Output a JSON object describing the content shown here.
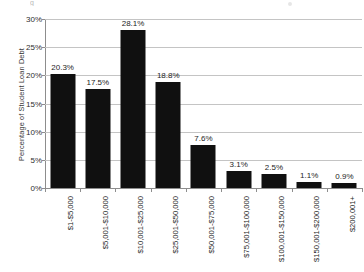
{
  "chart_data": {
    "type": "bar",
    "title": "",
    "xlabel": "",
    "ylabel": "Percentage of Student Loan Debt",
    "ylim": [
      0,
      30
    ],
    "ytick_labels": [
      "0%",
      "5%",
      "10%",
      "15%",
      "20%",
      "25%",
      "30%"
    ],
    "ytick_values": [
      0,
      5,
      10,
      15,
      20,
      25,
      30
    ],
    "grid": true,
    "legend": false,
    "categories": [
      "$1-$5,000",
      "$5,001-$10,000",
      "$10,001-$25,000",
      "$25,001-$50,000",
      "$50,001-$75,000",
      "$75,001-$100,000",
      "$100,001-$150,000",
      "$150,001-$200,000",
      "$200,001+"
    ],
    "values": [
      20.3,
      17.5,
      28.1,
      18.8,
      7.6,
      3.1,
      2.5,
      1.1,
      0.9
    ],
    "data_labels": [
      "20.3%",
      "17.5%",
      "28.1%",
      "18.8%",
      "7.6%",
      "3.1%",
      "2.5%",
      "1.1%",
      "0.9%"
    ],
    "bar_color": "#101010",
    "grid_color": "#c4c4c4",
    "axis_color": "#8d8d8d"
  },
  "artifacts": {
    "clipped_title_fragment": "g"
  }
}
